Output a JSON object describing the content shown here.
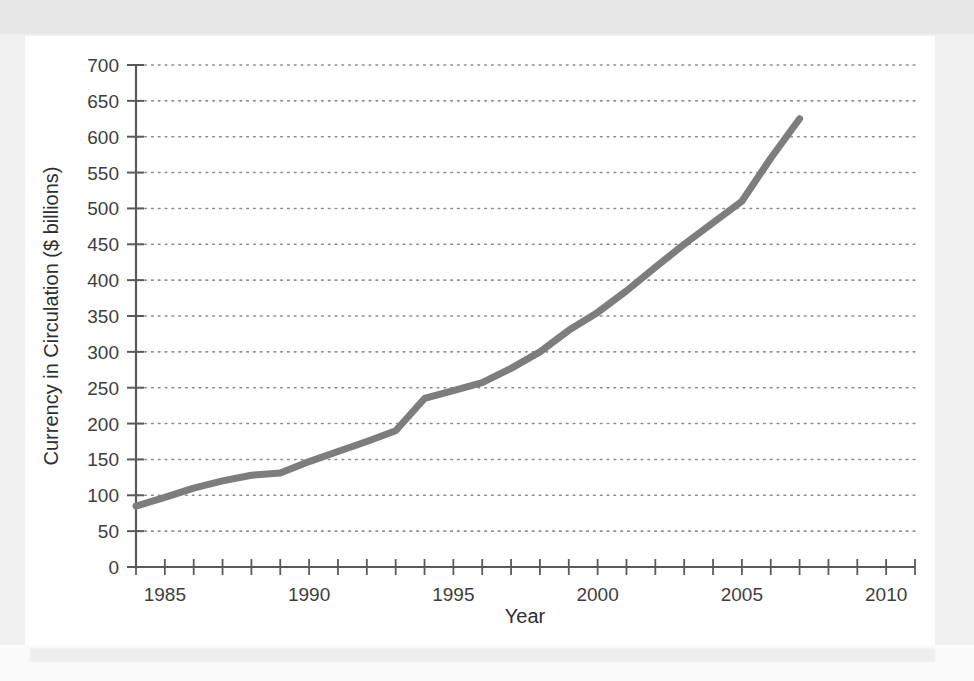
{
  "figure": {
    "background_color": "#f0f0f0",
    "card_color": "#ffffff",
    "line_color": "#7d7d7d",
    "grid_color": "#8d8d8d",
    "axis_color": "#5a5a5a"
  },
  "axes": {
    "x_title": "Year",
    "y_title": "Currency in Circulation ($ billions)",
    "x_ticks": [
      "1985",
      "1990",
      "1995",
      "2000",
      "2005",
      "2010"
    ],
    "y_ticks": [
      "0",
      "50",
      "100",
      "150",
      "200",
      "250",
      "300",
      "350",
      "400",
      "450",
      "500",
      "550",
      "600",
      "650",
      "700"
    ]
  },
  "chart_data": {
    "type": "line",
    "title": "",
    "xlabel": "Year",
    "ylabel": "Currency in Circulation ($ billions)",
    "xlim": [
      1984,
      2011
    ],
    "ylim": [
      0,
      700
    ],
    "xtick_values": [
      1985,
      1990,
      1995,
      2000,
      2005,
      2010
    ],
    "xtick_labels": [
      "1985",
      "1990",
      "1995",
      "2000",
      "2005",
      "2010"
    ],
    "x_minor_tick_step": 1,
    "ytick_values": [
      0,
      50,
      100,
      150,
      200,
      250,
      300,
      350,
      400,
      450,
      500,
      550,
      600,
      650,
      700
    ],
    "ytick_labels": [
      "0",
      "50",
      "100",
      "150",
      "200",
      "250",
      "300",
      "350",
      "400",
      "450",
      "500",
      "550",
      "600",
      "650",
      "700"
    ],
    "grid": "horizontal-dotted",
    "legend": "none",
    "series": [
      {
        "name": "Currency in Circulation",
        "color": "#7d7d7d",
        "x": [
          1984,
          1985,
          1986,
          1987,
          1988,
          1989,
          1990,
          1991,
          1992,
          1993,
          1994,
          1995,
          1996,
          1997,
          1998,
          1999,
          2000,
          2001,
          2002,
          2003,
          2004,
          2005,
          2006,
          2007
        ],
        "values": [
          85,
          97,
          110,
          120,
          128,
          131,
          147,
          161,
          175,
          190,
          235,
          246,
          257,
          277,
          300,
          330,
          355,
          385,
          418,
          450,
          480,
          510,
          570,
          625
        ]
      }
    ]
  }
}
